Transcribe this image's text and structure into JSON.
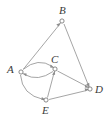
{
  "figure": {
    "name": "directed-graph",
    "background_color": "#ffffff",
    "width": 111,
    "height": 122,
    "edge_color": "#8e8e8e",
    "node_stroke_color": "#6d6d6d",
    "node_fill_color": "#ffffff",
    "label_color": "#3a3a3a"
  },
  "nodes": [
    {
      "id": "A",
      "label": "A",
      "x": 21,
      "y": 72,
      "label_x": 8,
      "label_y": 66
    },
    {
      "id": "B",
      "label": "B",
      "x": 62,
      "y": 21,
      "label_x": 62,
      "label_y": 4
    },
    {
      "id": "C",
      "label": "C",
      "x": 55,
      "y": 69,
      "label_x": 52,
      "label_y": 53
    },
    {
      "id": "D",
      "label": "D",
      "x": 90,
      "y": 89,
      "label_x": 95,
      "label_y": 86
    },
    {
      "id": "E",
      "label": "E",
      "x": 46,
      "y": 100,
      "label_x": 42,
      "label_y": 105
    }
  ],
  "edges": [
    {
      "from": "A",
      "to": "B",
      "directed": true,
      "curved": false
    },
    {
      "from": "B",
      "to": "D",
      "directed": true,
      "curved": false
    },
    {
      "from": "A",
      "to": "C",
      "directed": true,
      "curved": true
    },
    {
      "from": "C",
      "to": "A",
      "directed": true,
      "curved": true
    },
    {
      "from": "C",
      "to": "D",
      "directed": true,
      "curved": false
    },
    {
      "from": "A",
      "to": "E",
      "directed": true,
      "curved": true
    },
    {
      "from": "E",
      "to": "C",
      "directed": true,
      "curved": false
    },
    {
      "from": "E",
      "to": "D",
      "directed": true,
      "curved": false
    }
  ]
}
